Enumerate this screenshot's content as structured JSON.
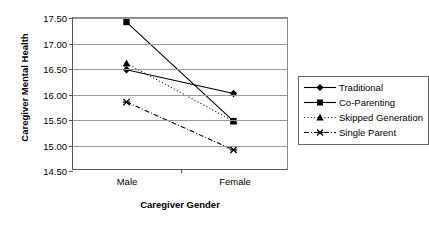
{
  "chart_data": {
    "type": "line",
    "title": "",
    "xlabel": "Caregiver Gender",
    "ylabel": "Caregiver Mental Health",
    "categories": [
      "Male",
      "Female"
    ],
    "ylim": [
      14.5,
      17.5
    ],
    "yticks": [
      "14.50",
      "15.00",
      "15.50",
      "16.00",
      "16.50",
      "17.00",
      "17.50"
    ],
    "ytick_values": [
      14.5,
      15.0,
      15.5,
      16.0,
      16.5,
      17.0,
      17.5
    ],
    "grid": true,
    "legend_position": "right",
    "series": [
      {
        "name": "Traditional",
        "values": [
          16.47,
          16.0
        ],
        "marker": "diamond",
        "linestyle": "solid",
        "color": "#000000"
      },
      {
        "name": "Co-Parenting",
        "values": [
          17.42,
          15.45
        ],
        "marker": "square",
        "linestyle": "solid",
        "color": "#000000"
      },
      {
        "name": "Skipped Generation",
        "values": [
          16.6,
          15.45
        ],
        "marker": "triangle",
        "linestyle": "dotted",
        "color": "#000000"
      },
      {
        "name": "Single Parent",
        "values": [
          15.83,
          14.88
        ],
        "marker": "cross",
        "linestyle": "dashdot",
        "color": "#000000"
      }
    ]
  },
  "legend": {
    "items": [
      {
        "label": "Traditional"
      },
      {
        "label": "Co-Parenting"
      },
      {
        "label": "Skipped Generation"
      },
      {
        "label": "Single Parent"
      }
    ]
  }
}
